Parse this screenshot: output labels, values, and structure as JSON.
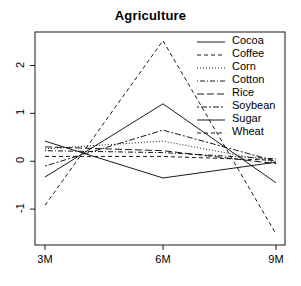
{
  "chart_data": {
    "type": "line",
    "title": "Agriculture",
    "xlabel": "",
    "ylabel": "",
    "x": [
      "3M",
      "6M",
      "9M"
    ],
    "categories": [
      "3M",
      "6M",
      "9M"
    ],
    "xtick_labels": [
      "3M",
      "6M",
      "9M"
    ],
    "ytick_labels": [
      "2",
      "1",
      "0",
      "-1"
    ],
    "ytick_values": [
      2,
      1,
      0,
      -1
    ],
    "ylim": [
      -1.75,
      2.7
    ],
    "grid": false,
    "legend_position": "top-right",
    "series": [
      {
        "name": "Cocoa",
        "values": [
          0.42,
          -0.35,
          -0.02
        ],
        "linestyle": "solid",
        "dasharray": ""
      },
      {
        "name": "Coffee",
        "values": [
          0.1,
          0.1,
          0.02
        ],
        "linestyle": "dashed",
        "dasharray": "4,3"
      },
      {
        "name": "Corn",
        "values": [
          0.26,
          0.42,
          -0.02
        ],
        "linestyle": "dotted",
        "dasharray": "1,2"
      },
      {
        "name": "Cotton",
        "values": [
          0.22,
          0.18,
          0.05
        ],
        "linestyle": "dotdash",
        "dasharray": "1,2,5,2"
      },
      {
        "name": "Rice",
        "values": [
          0.3,
          0.22,
          -0.05
        ],
        "linestyle": "longdash",
        "dasharray": "7,3"
      },
      {
        "name": "Soybean",
        "values": [
          -0.1,
          0.65,
          0.0
        ],
        "linestyle": "twodash",
        "dasharray": "2,2,6,2"
      },
      {
        "name": "Sugar",
        "values": [
          -0.33,
          1.2,
          -0.45
        ],
        "linestyle": "solid",
        "dasharray": ""
      },
      {
        "name": "Wheat",
        "values": [
          -0.92,
          2.52,
          -1.52
        ],
        "linestyle": "dashed",
        "dasharray": "4,3"
      }
    ]
  },
  "legend": {
    "items": [
      {
        "label": "Cocoa"
      },
      {
        "label": "Coffee"
      },
      {
        "label": "Corn"
      },
      {
        "label": "Cotton"
      },
      {
        "label": "Rice"
      },
      {
        "label": "Soybean"
      },
      {
        "label": "Sugar"
      },
      {
        "label": "Wheat"
      }
    ]
  },
  "colors": {
    "line": "#000000",
    "axis": "#000000",
    "background": "#ffffff"
  }
}
